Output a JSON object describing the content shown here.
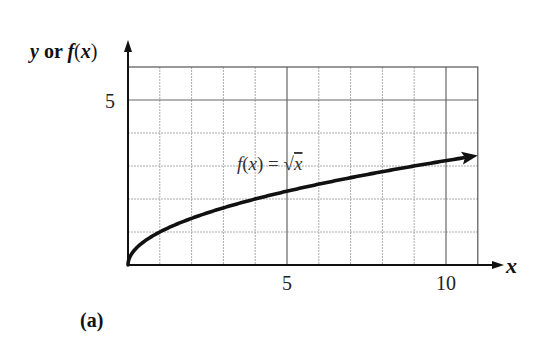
{
  "chart_data": {
    "type": "line",
    "title": "",
    "panel_label": "(a)",
    "xlabel": "x",
    "ylabel": "y or f(x)",
    "xlim": [
      0,
      11
    ],
    "ylim": [
      0,
      6
    ],
    "x_ticks": [
      5,
      10
    ],
    "x_tick_labels": [
      "5",
      "10"
    ],
    "y_ticks": [
      5
    ],
    "y_tick_labels": [
      "5"
    ],
    "grid": true,
    "grid_minor_step": 1,
    "grid_major_x": [
      5,
      10
    ],
    "grid_major_y": [
      5
    ],
    "legend": "none",
    "series": [
      {
        "name": "f(x) = √x",
        "function": "sqrt(x)",
        "x": [
          0,
          0.25,
          1,
          2,
          3,
          4,
          5,
          6,
          7,
          8,
          9,
          10,
          11
        ],
        "values": [
          0,
          0.5,
          1,
          1.414,
          1.732,
          2,
          2.236,
          2.449,
          2.646,
          2.828,
          3,
          3.162,
          3.317
        ],
        "end_arrow": true
      }
    ],
    "annotations": [
      {
        "text_parts": [
          "f",
          "(",
          "x",
          ") = √",
          "x"
        ],
        "text": "f(x) = √x",
        "x": 3.4,
        "y": 2.9
      }
    ]
  },
  "labels": {
    "y_axis_y": "y",
    "y_axis_or": " or ",
    "y_axis_f": "f",
    "y_axis_open": "(",
    "y_axis_x": "x",
    "y_axis_close": ")",
    "x_axis": "x",
    "tick_x5": "5",
    "tick_x10": "10",
    "tick_y5": "5",
    "annot_f": "f",
    "annot_open": "(",
    "annot_x": "x",
    "annot_close_eq": ") = ",
    "annot_sqrt": "√",
    "annot_arg": "x",
    "panel": "(a)"
  }
}
